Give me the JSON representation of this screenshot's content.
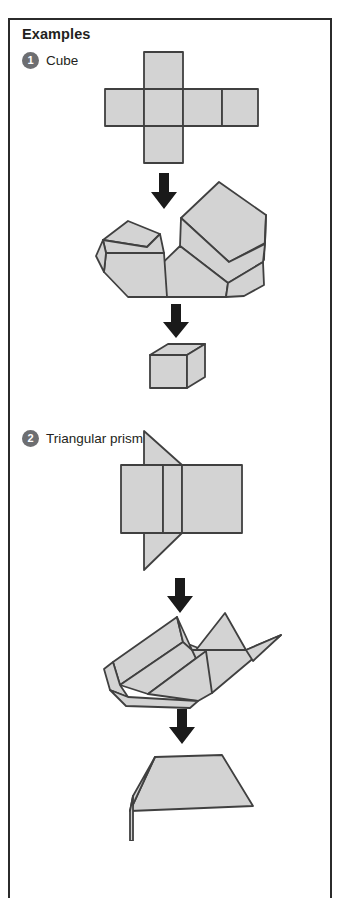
{
  "panel": {
    "heading": "Examples",
    "border_color": "#2b2b2b",
    "background": "#ffffff"
  },
  "theme": {
    "shape_fill": "#d3d3d3",
    "shape_stroke": "#404040",
    "badge_background": "#6d6e71",
    "badge_text": "#ffffff",
    "text_color": "#231f20",
    "arrow_color": "#1a1a1a"
  },
  "examples": [
    {
      "number": "1",
      "label": "Cube",
      "stages": [
        {
          "name": "net",
          "description": "cube net: cross of six squares"
        },
        {
          "name": "partially-folded",
          "description": "cube net partly folded up"
        },
        {
          "name": "solid",
          "description": "finished cube"
        }
      ],
      "arrows": 2
    },
    {
      "number": "2",
      "label": "Triangular prism",
      "stages": [
        {
          "name": "net",
          "description": "triangular prism net: three rectangles with two triangles"
        },
        {
          "name": "partially-folded",
          "description": "prism net partly folded up"
        },
        {
          "name": "solid",
          "description": "finished triangular prism"
        }
      ],
      "arrows": 2
    }
  ]
}
